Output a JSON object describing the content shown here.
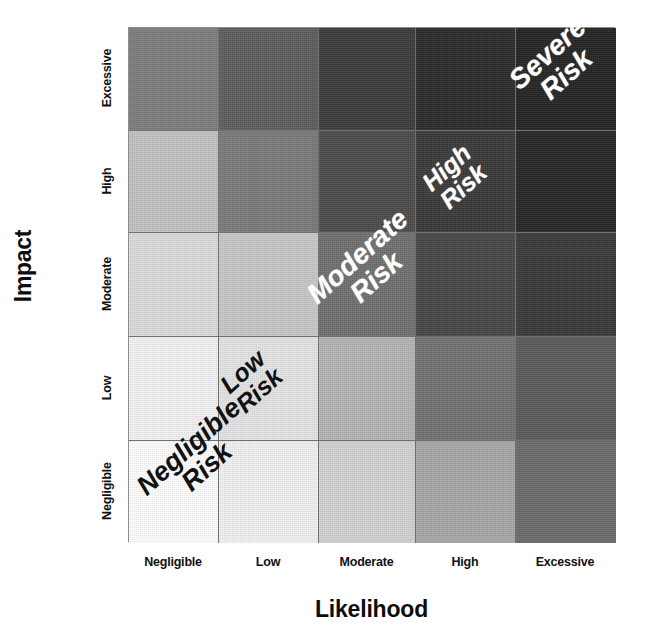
{
  "chart_data": {
    "type": "heatmap",
    "title": "",
    "xlabel": "Likelihood",
    "ylabel": "Impact",
    "x_categories": [
      "Negligible",
      "Low",
      "Moderate",
      "High",
      "Excessive"
    ],
    "y_categories": [
      "Negligible",
      "Low",
      "Moderate",
      "High",
      "Excessive"
    ],
    "y_categories_top_to_bottom": [
      "Excessive",
      "High",
      "Moderate",
      "Low",
      "Negligible"
    ],
    "grid": true,
    "legend": "none",
    "value_label": "risk score (likelihood index + impact index)",
    "rows_top_to_bottom": [
      {
        "impact": "Excessive",
        "cells": [
          {
            "likelihood": "Negligible",
            "score": 4,
            "color": "#7d7d7d"
          },
          {
            "likelihood": "Low",
            "score": 5,
            "color": "#5e5e5e"
          },
          {
            "likelihood": "Moderate",
            "score": 6,
            "color": "#3b3b3b"
          },
          {
            "likelihood": "High",
            "score": 7,
            "color": "#2a2a2a"
          },
          {
            "likelihood": "Excessive",
            "score": 8,
            "color": "#242424"
          }
        ]
      },
      {
        "impact": "High",
        "cells": [
          {
            "likelihood": "Negligible",
            "score": 3,
            "color": "#c2c2c2"
          },
          {
            "likelihood": "Low",
            "score": 4,
            "color": "#7a7a7a"
          },
          {
            "likelihood": "Moderate",
            "score": 5,
            "color": "#4c4c4c"
          },
          {
            "likelihood": "High",
            "score": 6,
            "color": "#3a3a3a"
          },
          {
            "likelihood": "Excessive",
            "score": 7,
            "color": "#262626"
          }
        ]
      },
      {
        "impact": "Moderate",
        "cells": [
          {
            "likelihood": "Negligible",
            "score": 2,
            "color": "#dcdcdc"
          },
          {
            "likelihood": "Low",
            "score": 3,
            "color": "#c8c8c8"
          },
          {
            "likelihood": "Moderate",
            "score": 4,
            "color": "#707070"
          },
          {
            "likelihood": "High",
            "score": 5,
            "color": "#474747"
          },
          {
            "likelihood": "Excessive",
            "score": 6,
            "color": "#3a3a3a"
          }
        ]
      },
      {
        "impact": "Low",
        "cells": [
          {
            "likelihood": "Negligible",
            "score": 1,
            "color": "#f3f3f3"
          },
          {
            "likelihood": "Low",
            "score": 2,
            "color": "#e4e4e4"
          },
          {
            "likelihood": "Moderate",
            "score": 3,
            "color": "#b4b4b4"
          },
          {
            "likelihood": "High",
            "score": 4,
            "color": "#737373"
          },
          {
            "likelihood": "Excessive",
            "score": 5,
            "color": "#5a5a5a"
          }
        ]
      },
      {
        "impact": "Negligible",
        "cells": [
          {
            "likelihood": "Negligible",
            "score": 0,
            "color": "#ffffff"
          },
          {
            "likelihood": "Low",
            "score": 1,
            "color": "#f2f2f2"
          },
          {
            "likelihood": "Moderate",
            "score": 2,
            "color": "#d2d2d2"
          },
          {
            "likelihood": "High",
            "score": 3,
            "color": "#a8a8a8"
          },
          {
            "likelihood": "Excessive",
            "score": 4,
            "color": "#6b6b6b"
          }
        ]
      }
    ],
    "bands": [
      {
        "id": "negligible",
        "line1": "Negligible",
        "line2": "Risk",
        "text_color": "#111111",
        "anchor_cell": "Negligible/Negligible"
      },
      {
        "id": "low",
        "line1": "Low",
        "line2": "Risk",
        "text_color": "#111111",
        "anchor_cell": "Low/Low"
      },
      {
        "id": "moderate",
        "line1": "Moderate",
        "line2": "Risk",
        "text_color": "#ffffff",
        "anchor_cell": "Moderate/Moderate"
      },
      {
        "id": "high",
        "line1": "High",
        "line2": "Risk",
        "text_color": "#ffffff",
        "anchor_cell": "High/High"
      },
      {
        "id": "severe",
        "line1": "Severe",
        "line2": "Risk",
        "text_color": "#ffffff",
        "anchor_cell": "Excessive/Excessive"
      }
    ]
  }
}
